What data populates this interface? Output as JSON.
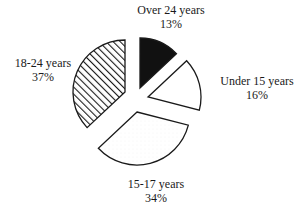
{
  "chart_data": {
    "type": "pie",
    "title": "",
    "exploded": true,
    "start_angle_deg": 0,
    "direction": "clockwise",
    "slices": [
      {
        "label": "Over 24 years",
        "value": 13,
        "value_label": "13%",
        "fill": "solid-black"
      },
      {
        "label": "Under 15 years",
        "value": 16,
        "value_label": "16%",
        "fill": "white"
      },
      {
        "label": "15-17 years",
        "value": 34,
        "value_label": "34%",
        "fill": "light-dotted"
      },
      {
        "label": "18-24 years",
        "value": 37,
        "value_label": "37%",
        "fill": "diagonal-hatch"
      }
    ],
    "categories": [
      "Over 24 years",
      "Under 15 years",
      "15-17 years",
      "18-24 years"
    ],
    "values": [
      13,
      16,
      34,
      37
    ],
    "unit": "%"
  },
  "colors": {
    "stroke": "#1a1a1a",
    "solid": "#111111",
    "background": "#ffffff"
  }
}
